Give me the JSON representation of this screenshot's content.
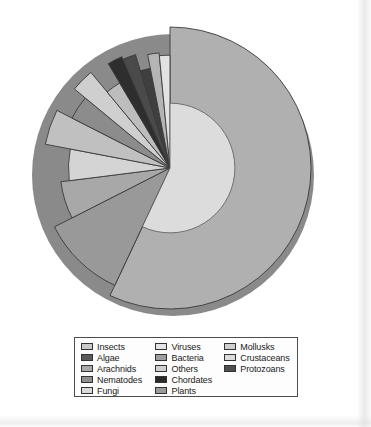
{
  "chart_data": {
    "type": "pie",
    "title": "",
    "subtitle": "",
    "xlabel": "",
    "ylabel": "",
    "grid": false,
    "legend_position": "bottom",
    "note": "Variable-radius (rose/nested) pie chart of described species by organism group; all slices in grayscale, largest slice shown with a lighter inner disc.",
    "categories": [
      "Insects",
      "Plants",
      "Arachnids",
      "Fungi",
      "Mollusks",
      "Nematodes",
      "Crustaceans",
      "Others",
      "Chordates",
      "Protozoans",
      "Algae",
      "Bacteria",
      "Viruses"
    ],
    "values": [
      57.0,
      10.5,
      5.5,
      5.0,
      4.5,
      3.5,
      3.0,
      2.5,
      2.0,
      1.8,
      1.6,
      1.6,
      1.5
    ],
    "units": "percent of described species",
    "slice_colors": [
      "#b0b0b0",
      "#999999",
      "#a8a8a8",
      "#d4d4d4",
      "#c0c0c0",
      "#8c8c8c",
      "#cfcfcf",
      "#bdbdbd",
      "#2e2e2e",
      "#4a4a4a",
      "#3f3f3f",
      "#b5b5b5",
      "#e2e2e2"
    ],
    "slice_radii": [
      1.0,
      0.92,
      0.78,
      0.72,
      0.9,
      0.78,
      0.88,
      0.7,
      0.86,
      0.84,
      0.72,
      0.82,
      0.8
    ]
  },
  "legend": {
    "columns": [
      {
        "items": [
          {
            "label": "Insects",
            "color": "#c8c8c8"
          },
          {
            "label": "Algae",
            "color": "#5a5a5a"
          },
          {
            "label": "Arachnids",
            "color": "#a9a9a9"
          },
          {
            "label": "Nematodes",
            "color": "#8f8f8f"
          },
          {
            "label": "Fungi",
            "color": "#d9d9d9"
          }
        ]
      },
      {
        "items": [
          {
            "label": "Viruses",
            "color": "#e4e4e4"
          },
          {
            "label": "Bacteria",
            "color": "#9e9e9e"
          },
          {
            "label": "Others",
            "color": "#d0d0d0"
          },
          {
            "label": "Chordates",
            "color": "#2a2a2a"
          },
          {
            "label": "Plants",
            "color": "#9a9a9a"
          }
        ]
      },
      {
        "items": [
          {
            "label": "Mollusks",
            "color": "#cfcfcf"
          },
          {
            "label": "Crustaceans",
            "color": "#dcdcdc"
          },
          {
            "label": "Protozoans",
            "color": "#4f4f4f"
          }
        ]
      }
    ]
  },
  "colors": {
    "page_background": "#ffffff",
    "legend_border": "#4d4d4d",
    "slice_outline": "#3a3a3a",
    "pie_depth_shadow": "#8a8a8a",
    "inner_disc": "#dcdcdc",
    "text": "#1a1a1a"
  }
}
